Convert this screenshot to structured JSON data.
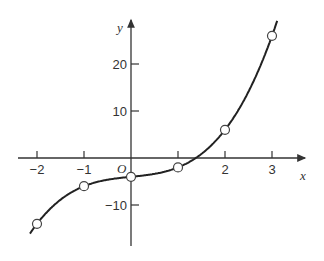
{
  "chart_data": {
    "type": "line",
    "title": "",
    "xlabel": "x",
    "ylabel": "y",
    "origin_label": "O",
    "xlim": [
      -2.2,
      3.35
    ],
    "ylim": [
      -18,
      29
    ],
    "x_ticks": [
      -2,
      -1,
      1,
      2,
      3
    ],
    "x_tick_labels": [
      "-2",
      "-1",
      "",
      "2",
      "3"
    ],
    "y_ticks": [
      -10,
      10,
      20
    ],
    "y_tick_labels": [
      "-10",
      "10",
      "20"
    ],
    "grid": false,
    "legend": null,
    "curve": "y = x^3 + x - 4",
    "series": [
      {
        "name": "points",
        "marker": "open-circle",
        "x": [
          -2,
          -1,
          0,
          1,
          2,
          3
        ],
        "y": [
          -14,
          -6,
          -4,
          -2,
          6,
          26
        ]
      }
    ],
    "colors": {
      "line": "#222222",
      "axis": "#333333",
      "marker_fill": "#ffffff"
    }
  }
}
